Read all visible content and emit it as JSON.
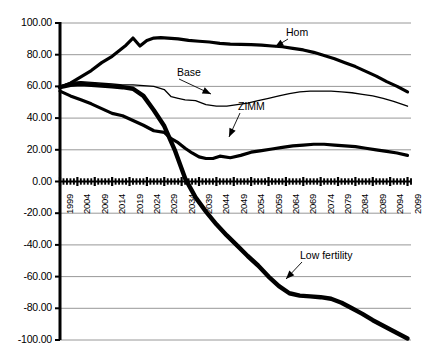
{
  "chart_data": {
    "type": "line",
    "title": "",
    "xlabel": "",
    "ylabel": "",
    "xlim": [
      1999,
      2100
    ],
    "ylim": [
      -100.0,
      100.0
    ],
    "grid": true,
    "legend_position": "inline-annotations",
    "y_ticks": [
      "100.00",
      "80.00",
      "60.00",
      "40.00",
      "20.00",
      "0.00",
      "-20.00",
      "-40.00",
      "-60.00",
      "-80.00",
      "-100.00"
    ],
    "y_tick_values": [
      100,
      80,
      60,
      40,
      20,
      0,
      -20,
      -40,
      -60,
      -80,
      -100
    ],
    "x_ticks": [
      "1999",
      "2004",
      "2009",
      "2014",
      "2019",
      "2024",
      "2029",
      "2034",
      "2039",
      "2044",
      "2049",
      "2054",
      "2059",
      "2064",
      "2069",
      "2074",
      "2079",
      "2084",
      "2089",
      "2094",
      "2099"
    ],
    "x_tick_values": [
      1999,
      2004,
      2009,
      2014,
      2019,
      2024,
      2029,
      2034,
      2039,
      2044,
      2049,
      2054,
      2059,
      2064,
      2069,
      2074,
      2079,
      2084,
      2089,
      2094,
      2099
    ],
    "annotations": [
      {
        "text": "Hom",
        "x": 2074,
        "y": 84
      },
      {
        "text": "Base",
        "x": 2046,
        "y": 68
      },
      {
        "text": "ZIMM",
        "x": 2057,
        "y": 40
      },
      {
        "text": "Low fertility",
        "x": 2064,
        "y": -52
      }
    ],
    "series": [
      {
        "name": "Hom",
        "style": "thick",
        "x": [
          1999,
          2002,
          2005,
          2008,
          2011,
          2014,
          2016,
          2018,
          2020,
          2022,
          2024,
          2026,
          2028,
          2030,
          2033,
          2036,
          2039,
          2042,
          2045,
          2048,
          2051,
          2054,
          2057,
          2060,
          2063,
          2066,
          2069,
          2072,
          2075,
          2078,
          2081,
          2084,
          2087,
          2090,
          2093,
          2096,
          2099
        ],
        "y": [
          59.5,
          62.0,
          66.0,
          70.0,
          75.0,
          79.0,
          82.5,
          86.0,
          90.5,
          85.5,
          89.0,
          90.5,
          90.8,
          90.5,
          90.0,
          89.0,
          88.5,
          88.0,
          87.2,
          86.7,
          86.5,
          86.3,
          86.0,
          85.5,
          85.0,
          84.0,
          83.0,
          81.5,
          79.5,
          77.5,
          75.0,
          72.5,
          69.5,
          66.5,
          63.0,
          60.0,
          56.5
        ]
      },
      {
        "name": "Base",
        "style": "thin",
        "x": [
          1999,
          2002,
          2005,
          2008,
          2011,
          2014,
          2017,
          2020,
          2023,
          2026,
          2029,
          2031,
          2033,
          2035,
          2038,
          2041,
          2044,
          2047,
          2050,
          2053,
          2056,
          2059,
          2062,
          2065,
          2068,
          2071,
          2074,
          2077,
          2080,
          2083,
          2086,
          2089,
          2092,
          2095,
          2099
        ],
        "y": [
          60.0,
          62.5,
          63.0,
          62.5,
          62.0,
          61.5,
          61.0,
          61.0,
          60.5,
          60.0,
          58.0,
          53.5,
          52.5,
          51.5,
          51.0,
          48.5,
          47.5,
          47.5,
          48.5,
          49.5,
          51.0,
          52.5,
          54.0,
          55.5,
          56.5,
          57.0,
          57.0,
          57.0,
          56.5,
          56.0,
          55.0,
          54.0,
          52.5,
          50.5,
          47.5
        ]
      },
      {
        "name": "ZIMM",
        "style": "thick",
        "x": [
          1999,
          2002,
          2005,
          2008,
          2011,
          2014,
          2017,
          2020,
          2023,
          2026,
          2029,
          2031,
          2033,
          2035,
          2037,
          2039,
          2041,
          2043,
          2045,
          2048,
          2051,
          2054,
          2057,
          2060,
          2063,
          2066,
          2069,
          2072,
          2075,
          2078,
          2081,
          2084,
          2087,
          2090,
          2093,
          2096,
          2099
        ],
        "y": [
          57.0,
          54.0,
          51.5,
          49.0,
          46.0,
          43.0,
          41.5,
          38.5,
          35.5,
          32.0,
          31.0,
          27.0,
          24.5,
          21.0,
          18.0,
          15.5,
          14.5,
          14.5,
          16.0,
          15.0,
          16.5,
          18.5,
          19.5,
          20.5,
          21.5,
          22.5,
          23.0,
          23.5,
          23.5,
          23.0,
          22.5,
          22.0,
          21.0,
          20.0,
          19.0,
          18.0,
          16.5
        ]
      },
      {
        "name": "Low fertility",
        "style": "extra-thick",
        "x": [
          1999,
          2002,
          2005,
          2008,
          2011,
          2014,
          2017,
          2020,
          2023,
          2026,
          2029,
          2032,
          2035,
          2038,
          2041,
          2044,
          2047,
          2050,
          2053,
          2056,
          2059,
          2062,
          2065,
          2068,
          2071,
          2074,
          2077,
          2080,
          2083,
          2086,
          2089,
          2092,
          2095,
          2099
        ],
        "y": [
          59.5,
          61.0,
          61.5,
          61.0,
          60.5,
          60.0,
          59.5,
          58.5,
          54.0,
          45.0,
          35.0,
          20.0,
          2.0,
          -10.0,
          -19.0,
          -27.0,
          -34.0,
          -40.5,
          -47.0,
          -53.0,
          -60.0,
          -66.0,
          -70.5,
          -72.0,
          -72.5,
          -73.0,
          -74.0,
          -76.5,
          -80.0,
          -83.5,
          -87.5,
          -91.0,
          -94.5,
          -99.0
        ]
      }
    ]
  },
  "axes": {
    "axis_color": "#000000",
    "grid_color": "#8c8c8c",
    "line_color": "#000000",
    "background": "#ffffff"
  }
}
